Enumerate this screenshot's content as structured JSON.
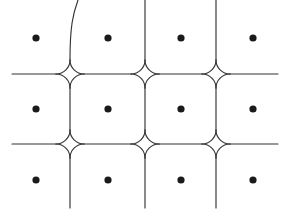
{
  "figure": {
    "kind": "geometric-lattice-diagram",
    "background_color": "#ffffff",
    "canvas": {
      "width": 289,
      "height": 214
    }
  },
  "style": {
    "line_color": "#333333",
    "line_width": 1.15,
    "dot_color": "#1a1a1a",
    "dot_radius": 3.6,
    "arc_radius": 14
  },
  "geometry": {
    "vertical_gridlines_x": [
      70,
      145,
      216
    ],
    "horizontal_gridlines_y": [
      74,
      144
    ],
    "vertical_extent": {
      "top": 0,
      "bottom": 208
    },
    "horizontal_extent": {
      "left": 12,
      "right": 278
    },
    "junctions": [
      {
        "x": 70,
        "y": 74
      },
      {
        "x": 145,
        "y": 74
      },
      {
        "x": 216,
        "y": 74
      },
      {
        "x": 70,
        "y": 144
      },
      {
        "x": 145,
        "y": 144
      },
      {
        "x": 216,
        "y": 144
      }
    ],
    "top_line_curve_note": "leftmost vertical bends right above y=40, reaching x=78 at y=0"
  },
  "dots": {
    "columns_x": [
      36,
      108,
      181,
      253
    ],
    "rows_y": [
      38,
      109,
      180
    ],
    "count": 12,
    "points": [
      {
        "x": 36,
        "y": 38
      },
      {
        "x": 108,
        "y": 38
      },
      {
        "x": 181,
        "y": 38
      },
      {
        "x": 253,
        "y": 38
      },
      {
        "x": 36,
        "y": 109
      },
      {
        "x": 108,
        "y": 109
      },
      {
        "x": 181,
        "y": 109
      },
      {
        "x": 253,
        "y": 109
      },
      {
        "x": 36,
        "y": 180
      },
      {
        "x": 108,
        "y": 180
      },
      {
        "x": 181,
        "y": 180
      },
      {
        "x": 253,
        "y": 180
      }
    ]
  }
}
